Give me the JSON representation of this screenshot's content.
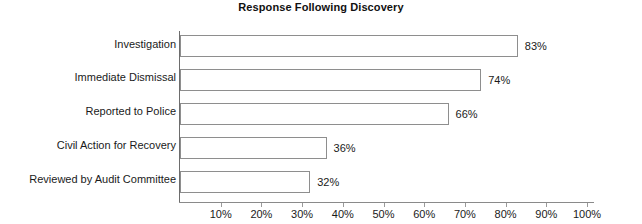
{
  "chart_data": {
    "type": "bar",
    "orientation": "horizontal",
    "title": "Response Following Discovery",
    "xlabel": "",
    "ylabel": "",
    "categories": [
      "Investigation",
      "Immediate Dismissal",
      "Reported to Police",
      "Civil Action for Recovery",
      "Reviewed by Audit Committee"
    ],
    "values": [
      83,
      74,
      66,
      36,
      32
    ],
    "value_labels": [
      "83%",
      "74%",
      "66%",
      "36%",
      "32%"
    ],
    "xlim": [
      0,
      100
    ],
    "xticks": [
      10,
      20,
      30,
      40,
      50,
      60,
      70,
      80,
      90,
      100
    ],
    "xtick_labels": [
      "10%",
      "20%",
      "30%",
      "40%",
      "50%",
      "60%",
      "70%",
      "80%",
      "90%",
      "100%"
    ],
    "grid": false,
    "legend": false,
    "bar_fill_color": "#ffffff",
    "bar_border_color": "#8e8e8e",
    "background_color": "#ffffff",
    "text_color": "#1a1a1a"
  }
}
